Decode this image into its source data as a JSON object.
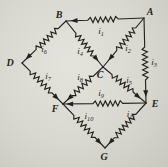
{
  "figure": {
    "kind": "resistor-network-circuit-diagram",
    "background_color": "#d8d7d0",
    "ink_color": "#24221e",
    "nodes": [
      {
        "id": "A",
        "x": 144,
        "y": 18,
        "label": "A",
        "label_x": 150,
        "label_y": 15
      },
      {
        "id": "B",
        "x": 66,
        "y": 21,
        "label": "B",
        "label_x": 59,
        "label_y": 18
      },
      {
        "id": "C",
        "x": 103,
        "y": 67,
        "label": "C",
        "label_x": 100,
        "label_y": 78
      },
      {
        "id": "D",
        "x": 22,
        "y": 63,
        "label": "D",
        "label_x": 10,
        "label_y": 66
      },
      {
        "id": "E",
        "x": 146,
        "y": 103,
        "label": "E",
        "label_x": 155,
        "label_y": 107
      },
      {
        "id": "F",
        "x": 63,
        "y": 104,
        "label": "F",
        "label_x": 55,
        "label_y": 112
      },
      {
        "id": "G",
        "x": 105,
        "y": 148,
        "label": "G",
        "label_x": 104,
        "label_y": 160
      }
    ],
    "edges": [
      {
        "id": "i1",
        "label": "i",
        "sub": "1",
        "from": "A",
        "to": "B",
        "res_t0": 0.33,
        "res_t1": 0.72,
        "arrow_t": 0.94,
        "label_x": 101,
        "label_y": 34
      },
      {
        "id": "i2",
        "label": "i",
        "sub": "2",
        "from": "A",
        "to": "C",
        "res_t0": 0.2,
        "res_t1": 0.66,
        "arrow_t": 0.87,
        "label_x": 128,
        "label_y": 51
      },
      {
        "id": "i3",
        "label": "i",
        "sub": "3",
        "from": "A",
        "to": "E",
        "res_t0": 0.34,
        "res_t1": 0.73,
        "arrow_t": 0.93,
        "label_x": 154,
        "label_y": 65
      },
      {
        "id": "i4",
        "label": "i",
        "sub": "4",
        "from": "B",
        "to": "C",
        "res_t0": 0.27,
        "res_t1": 0.76,
        "arrow_t": 0.88,
        "label_x": 80,
        "label_y": 54
      },
      {
        "id": "i5",
        "label": "i",
        "sub": "5",
        "from": "C",
        "to": "E",
        "res_t0": 0.21,
        "res_t1": 0.7,
        "arrow_t": 0.88,
        "label_x": 129,
        "label_y": 83
      },
      {
        "id": "i6",
        "label": "i",
        "sub": "6",
        "from": "B",
        "to": "D",
        "res_t0": 0.18,
        "res_t1": 0.68,
        "arrow_t": 0.92,
        "label_x": 44,
        "label_y": 52
      },
      {
        "id": "i7",
        "label": "i",
        "sub": "7",
        "from": "D",
        "to": "F",
        "res_t0": 0.2,
        "res_t1": 0.73,
        "arrow_t": 0.9,
        "label_x": 48,
        "label_y": 79
      },
      {
        "id": "i8",
        "label": "i",
        "sub": "8",
        "from": "C",
        "to": "F",
        "res_t0": 0.25,
        "res_t1": 0.77,
        "arrow_t": 0.9,
        "label_x": 80,
        "label_y": 80
      },
      {
        "id": "i9",
        "label": "i",
        "sub": "9",
        "from": "E",
        "to": "F",
        "res_t0": 0.28,
        "res_t1": 0.64,
        "arrow_t": 0.96,
        "label_x": 101,
        "label_y": 96
      },
      {
        "id": "i10",
        "label": "i",
        "sub": "10",
        "from": "F",
        "to": "G",
        "res_t0": 0.26,
        "res_t1": 0.76,
        "arrow_t": 0.92,
        "label_x": 89,
        "label_y": 119
      },
      {
        "id": "i11",
        "label": "i",
        "sub": "11",
        "from": "E",
        "to": "G",
        "res_t0": 0.25,
        "res_t1": 0.77,
        "arrow_t": 0.92,
        "label_x": 131,
        "label_y": 117
      }
    ]
  }
}
